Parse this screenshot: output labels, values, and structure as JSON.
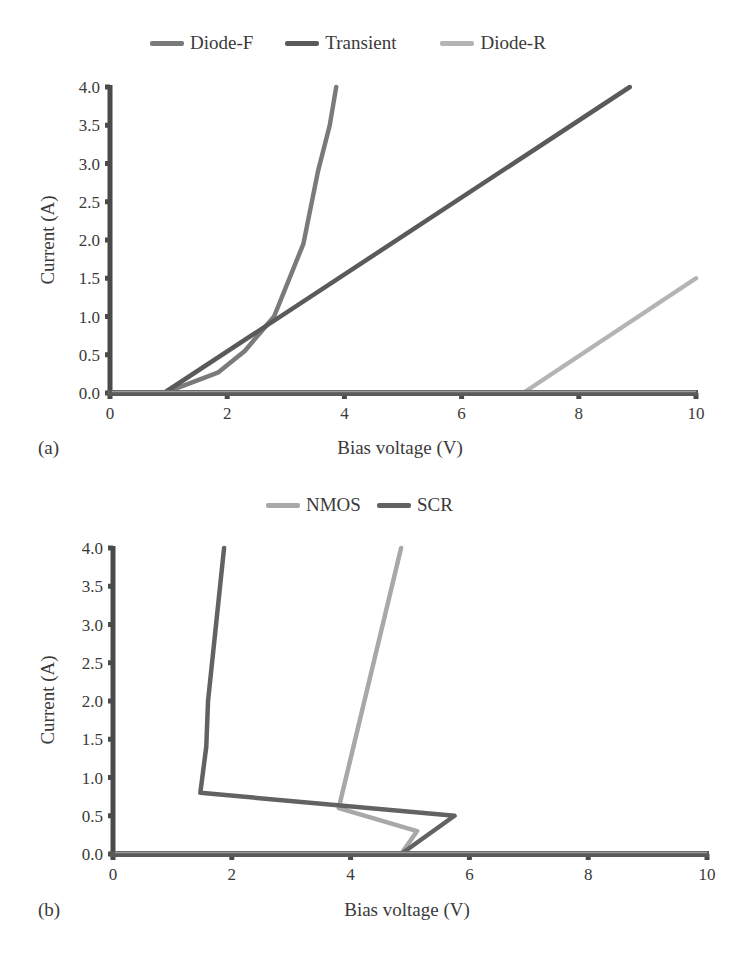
{
  "colors": {
    "diode_f": "#7a7a7a",
    "transient": "#5a5a5a",
    "diode_r": "#b4b4b4",
    "nmos": "#a8a8a8",
    "scr": "#626262",
    "axis": "#4a4a4a"
  },
  "chart_data": [
    {
      "panel_label": "(a)",
      "type": "line",
      "title": "",
      "xlabel": "Bias voltage (V)",
      "ylabel": "Current (A)",
      "xlim": [
        0,
        10
      ],
      "ylim": [
        0,
        4.0
      ],
      "x_ticks": [
        "0",
        "2",
        "4",
        "6",
        "8",
        "10"
      ],
      "y_ticks": [
        "0.0",
        "0.5",
        "1.0",
        "1.5",
        "2.0",
        "2.5",
        "3.0",
        "3.5",
        "4.0"
      ],
      "grid": false,
      "legend_position": "top",
      "series": [
        {
          "name": "Diode-F",
          "color_key": "diode_f",
          "points": [
            [
              0,
              0
            ],
            [
              0.9,
              0
            ],
            [
              1.2,
              0.08
            ],
            [
              1.85,
              0.27
            ],
            [
              2.3,
              0.55
            ],
            [
              2.8,
              1.0
            ],
            [
              3.3,
              1.95
            ],
            [
              3.55,
              2.9
            ],
            [
              3.75,
              3.5
            ],
            [
              3.86,
              4.0
            ]
          ]
        },
        {
          "name": "Transient",
          "color_key": "transient",
          "points": [
            [
              0,
              0
            ],
            [
              0.92,
              0
            ],
            [
              8.87,
              4.0
            ]
          ]
        },
        {
          "name": "Diode-R",
          "color_key": "diode_r",
          "points": [
            [
              0,
              0
            ],
            [
              7.05,
              0
            ],
            [
              10.0,
              1.5
            ]
          ]
        }
      ]
    },
    {
      "panel_label": "(b)",
      "type": "line",
      "title": "",
      "xlabel": "Bias voltage (V)",
      "ylabel": "Current (A)",
      "xlim": [
        0,
        10
      ],
      "ylim": [
        0,
        4.0
      ],
      "x_ticks": [
        "0",
        "2",
        "4",
        "6",
        "8",
        "10"
      ],
      "y_ticks": [
        "0.0",
        "0.5",
        "1.0",
        "1.5",
        "2.0",
        "2.5",
        "3.0",
        "3.5",
        "4.0"
      ],
      "grid": false,
      "legend_position": "top",
      "series": [
        {
          "name": "NMOS",
          "color_key": "nmos",
          "points": [
            [
              0,
              0
            ],
            [
              4.85,
              0
            ],
            [
              5.12,
              0.3
            ],
            [
              3.8,
              0.6
            ],
            [
              4.85,
              4.0
            ]
          ]
        },
        {
          "name": "SCR",
          "color_key": "scr",
          "points": [
            [
              0,
              0
            ],
            [
              4.85,
              0
            ],
            [
              5.75,
              0.5
            ],
            [
              1.47,
              0.8
            ],
            [
              1.57,
              1.4
            ],
            [
              1.6,
              2.0
            ],
            [
              1.87,
              4.0
            ]
          ]
        }
      ]
    }
  ],
  "legends": {
    "a": [
      {
        "label": "Diode-F",
        "color_key": "diode_f"
      },
      {
        "label": "Transient",
        "color_key": "transient"
      },
      {
        "label": "Diode-R",
        "color_key": "diode_r"
      }
    ],
    "b": [
      {
        "label": "NMOS",
        "color_key": "nmos"
      },
      {
        "label": "SCR",
        "color_key": "scr"
      }
    ]
  }
}
